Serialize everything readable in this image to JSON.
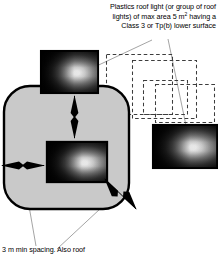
{
  "diagram": {
    "colors": {
      "body_fill": "#c9c9c9",
      "outline": "#000000",
      "dashed_outline": "#3a3a3a",
      "leader_line": "#8a8a8a",
      "gradient_dark": "#000000",
      "gradient_light": "#ffffff",
      "background": "#ffffff"
    },
    "annotations": {
      "top": {
        "name": "plastics-roof-light-note",
        "lines": [
          "Plastics roof light (or group of roof",
          "lights) of max area 5 m² having a",
          "Class 3 or Tp(b) lower surface"
        ],
        "line1": "Plastics roof light (or group of roof",
        "line2_pre": "lights) of max area 5 m",
        "line2_sup": "2",
        "line2_post": " having a",
        "line3": "Class 3 or Tp(b) lower surface"
      },
      "bottom": {
        "name": "min-spacing-note",
        "text": "3 m min spacing. Also roof"
      }
    },
    "shapes": {
      "body": {
        "name": "rounded-roof-area",
        "fill": "#c9c9c9"
      },
      "rooflights": [
        {
          "name": "rooflight-top",
          "x": 40,
          "y": 50,
          "w": 59,
          "h": 44
        },
        {
          "name": "rooflight-center",
          "x": 46,
          "y": 141,
          "w": 62,
          "h": 42
        },
        {
          "name": "rooflight-right",
          "x": 152,
          "y": 124,
          "w": 66,
          "h": 45
        }
      ],
      "dashed_zones": [
        {
          "name": "dashed-zone-1",
          "x": 106,
          "y": 54,
          "w": 66,
          "h": 60
        },
        {
          "name": "dashed-zone-2",
          "x": 132,
          "y": 60,
          "w": 64,
          "h": 58
        },
        {
          "name": "dashed-zone-3",
          "x": 143,
          "y": 80,
          "w": 44,
          "h": 34
        },
        {
          "name": "dashed-zone-4",
          "x": 155,
          "y": 84,
          "w": 59,
          "h": 38
        }
      ],
      "arrows": [
        {
          "name": "vertical-spacing-arrow",
          "orientation": "vertical"
        },
        {
          "name": "horizontal-spacing-arrow",
          "orientation": "horizontal"
        },
        {
          "name": "diagonal-spacing-arrow",
          "orientation": "diagonal"
        }
      ],
      "leaders": [
        {
          "name": "leader-to-top-rooflight"
        },
        {
          "name": "leader-to-right-rooflight"
        },
        {
          "name": "leader-to-edge-spacing"
        },
        {
          "name": "leader-to-diagonal-spacing"
        }
      ]
    }
  }
}
